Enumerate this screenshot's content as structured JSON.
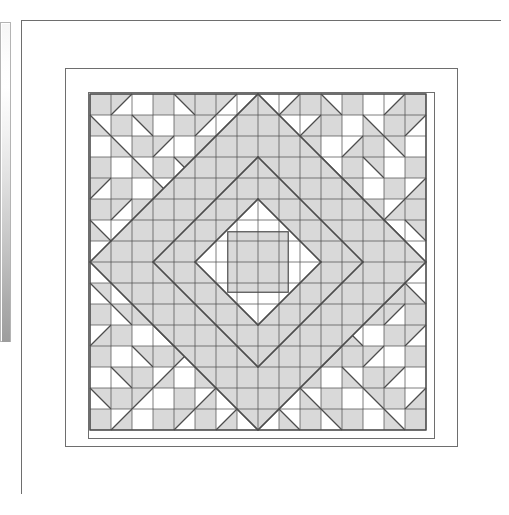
{
  "document": {
    "title": "Quilt block pattern diagram",
    "page_kind": "technical-line-drawing"
  },
  "scrollbar": {
    "name": "vertical-scrollbar",
    "orientation": "vertical",
    "track_color": "#b4b4b4",
    "thumb_gradient_top": "#ffffff",
    "thumb_gradient_bottom": "#9d9d9d",
    "x": 0,
    "y": 22,
    "width": 11,
    "height": 320
  },
  "figure": {
    "caption": "",
    "stroke_color": "#4d4d4d",
    "outer_stroke_color": "#6e6e6e",
    "fill_shaded": "#d9d9d9",
    "fill_light": "#ffffff",
    "border_fill": "#ffffff",
    "frames": [
      {
        "name": "outer-border",
        "x": 0,
        "y": 0,
        "w": 480,
        "h": 474,
        "fill": "#ffffff"
      },
      {
        "name": "inner-border",
        "x": 44,
        "y": 48,
        "w": 392,
        "h": 378,
        "fill": "#ffffff"
      },
      {
        "name": "pattern-area",
        "x": 67,
        "y": 72,
        "w": 346,
        "h": 346,
        "fill": "#ffffff"
      }
    ]
  },
  "chart_data": {
    "type": "heatmap",
    "subtitle": "16 x 16 unit grid, point-symmetric diamond medallion",
    "xlabel": "",
    "ylabel": "",
    "grid": true,
    "legend_position": "none",
    "rows": 16,
    "cols": 16,
    "cell_px": 21,
    "origin_x": 69,
    "origin_y": 74,
    "palette": {
      "shaded": "#d9d9d9",
      "light": "#ffffff",
      "line": "#4d4d4d"
    },
    "unit_codes": {
      "F": "full shaded square",
      "E": "empty (light) square",
      "A": "half-square triangle, shaded lower-left (diagonal from top-left to bottom-right)",
      "B": "half-square triangle, shaded upper-right (diagonal from top-left to bottom-right)",
      "C": "half-square triangle, shaded upper-left (diagonal from bottom-left to top-right)",
      "D": "half-square triangle, shaded lower-right (diagonal from bottom-left to top-right)"
    },
    "cells": [
      [
        "F",
        "C",
        "E",
        "F",
        "B",
        "F",
        "C",
        "E",
        "E",
        "D",
        "F",
        "A",
        "F",
        "E",
        "D",
        "F"
      ],
      [
        "A",
        "F",
        "B",
        "E",
        "F",
        "C",
        "E",
        "F",
        "F",
        "E",
        "D",
        "F",
        "E",
        "A",
        "F",
        "C"
      ],
      [
        "E",
        "A",
        "F",
        "C",
        "E",
        "F",
        "C",
        "E",
        "E",
        "D",
        "F",
        "E",
        "D",
        "F",
        "B",
        "E"
      ],
      [
        "F",
        "E",
        "A",
        "F",
        "B",
        "E",
        "F",
        "C",
        "D",
        "F",
        "E",
        "A",
        "F",
        "B",
        "E",
        "F"
      ],
      [
        "C",
        "F",
        "E",
        "A",
        "F",
        "B",
        "E",
        "F",
        "F",
        "E",
        "A",
        "F",
        "B",
        "E",
        "F",
        "D"
      ],
      [
        "F",
        "C",
        "F",
        "E",
        "A",
        "F",
        "C",
        "E",
        "E",
        "D",
        "F",
        "B",
        "E",
        "F",
        "D",
        "F"
      ],
      [
        "A",
        "E",
        "F",
        "C",
        "E",
        "A",
        "F",
        "B",
        "C",
        "F",
        "D",
        "E",
        "F",
        "E",
        "A",
        "B"
      ],
      [
        "E",
        "F",
        "C",
        "E",
        "F",
        "E",
        "A",
        "F",
        "F",
        "B",
        "E",
        "F",
        "E",
        "D",
        "F",
        "E"
      ],
      [
        "E",
        "F",
        "B",
        "E",
        "F",
        "E",
        "D",
        "F",
        "F",
        "C",
        "E",
        "F",
        "E",
        "A",
        "F",
        "E"
      ],
      [
        "B",
        "E",
        "F",
        "D",
        "E",
        "B",
        "F",
        "C",
        "A",
        "F",
        "E",
        "E",
        "F",
        "E",
        "D",
        "A"
      ],
      [
        "F",
        "B",
        "F",
        "E",
        "D",
        "F",
        "B",
        "E",
        "E",
        "C",
        "F",
        "A",
        "E",
        "F",
        "C",
        "F"
      ],
      [
        "D",
        "F",
        "E",
        "B",
        "F",
        "C",
        "E",
        "F",
        "F",
        "E",
        "D",
        "F",
        "A",
        "E",
        "F",
        "C"
      ],
      [
        "F",
        "E",
        "B",
        "F",
        "C",
        "E",
        "F",
        "D",
        "A",
        "F",
        "E",
        "D",
        "F",
        "C",
        "E",
        "F"
      ],
      [
        "E",
        "B",
        "F",
        "D",
        "E",
        "F",
        "D",
        "E",
        "E",
        "A",
        "F",
        "E",
        "A",
        "F",
        "C",
        "E"
      ],
      [
        "B",
        "F",
        "C",
        "E",
        "F",
        "D",
        "E",
        "F",
        "F",
        "E",
        "A",
        "F",
        "E",
        "B",
        "F",
        "D"
      ],
      [
        "F",
        "D",
        "E",
        "F",
        "C",
        "F",
        "D",
        "E",
        "E",
        "A",
        "F",
        "B",
        "F",
        "E",
        "A",
        "F"
      ]
    ],
    "medallion": {
      "description": "Concentric diamonds centred on the block",
      "rings": [
        {
          "name": "centre-square",
          "half_diagonal_units": 2,
          "fill": "#d9d9d9"
        },
        {
          "name": "inner-diamond",
          "half_diagonal_units": 3,
          "fill": "#ffffff"
        },
        {
          "name": "middle-diamond",
          "half_diagonal_units": 5,
          "fill": "#d9d9d9"
        },
        {
          "name": "outer-diamond",
          "half_diagonal_units": 8,
          "fill": "#d9d9d9"
        }
      ]
    }
  }
}
